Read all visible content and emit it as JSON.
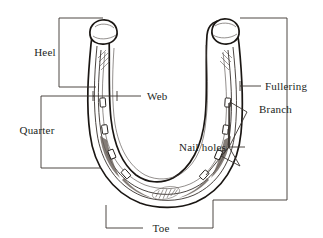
{
  "figure": {
    "style": "black-and-white line engraving",
    "background_color": "#ffffff",
    "ink_color": "#1a1613",
    "label_color": "#221f1d"
  },
  "labels": {
    "heel": "Heel",
    "web": "Web",
    "quarter": "Quarter",
    "fullering": "Fullering",
    "branch": "Branch",
    "nail_holes": "Nail holes",
    "toe": "Toe"
  },
  "callouts": [
    {
      "id": "heel",
      "label": "Heel",
      "marker": "bracket-vertical",
      "side": "left",
      "text_x": 45,
      "text_y": 52
    },
    {
      "id": "web",
      "label": "Web",
      "marker": "leader-with-ticks",
      "side": "left",
      "text_x": 116,
      "text_y": 99
    },
    {
      "id": "quarter",
      "label": "Quarter",
      "marker": "bracket-vertical",
      "side": "left",
      "text_x": 37,
      "text_y": 130
    },
    {
      "id": "fullering",
      "label": "Fullering",
      "marker": "leader-line",
      "side": "right",
      "text_x": 266,
      "text_y": 89
    },
    {
      "id": "branch",
      "label": "Branch",
      "marker": "bracket-vertical",
      "side": "right",
      "text_x": 260,
      "text_y": 112
    },
    {
      "id": "nail-holes",
      "label": "Nail holes",
      "marker": "fan-leaders",
      "side": "right",
      "text_x": 178,
      "text_y": 148
    },
    {
      "id": "toe",
      "label": "Toe",
      "marker": "bracket-horizontal",
      "side": "bottom",
      "text_x": 160,
      "text_y": 231
    }
  ],
  "parts_count": 7,
  "nail_hole_count": 8
}
